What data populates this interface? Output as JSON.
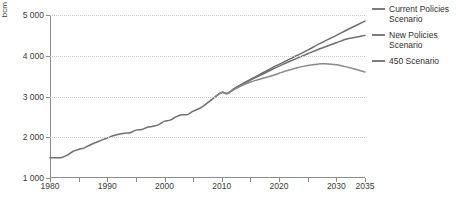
{
  "chart_data": {
    "type": "line",
    "title": "",
    "xlabel": "",
    "ylabel": "bcm",
    "unit": "bcm",
    "xlim": [
      1980,
      2035
    ],
    "ylim": [
      1000,
      5000
    ],
    "grid": true,
    "legend_position": "right",
    "y_ticks": [
      "1 000",
      "2 000",
      "3 000",
      "4 000",
      "5 000"
    ],
    "y_tick_values": [
      1000,
      2000,
      3000,
      4000,
      5000
    ],
    "x_ticks": [
      "1980",
      "1990",
      "2000",
      "2010",
      "2020",
      "2030",
      "2035"
    ],
    "x_tick_values": [
      1980,
      1990,
      2000,
      2010,
      2020,
      2030,
      2035
    ],
    "x_minor_ticks": [
      1985,
      1995,
      2005,
      2015,
      2025
    ],
    "series": [
      {
        "name": "Current Policies Scenario",
        "color": "#6f6f6f",
        "x": [
          1980,
          1981,
          1982,
          1983,
          1984,
          1985,
          1986,
          1987,
          1988,
          1989,
          1990,
          1991,
          1992,
          1993,
          1994,
          1995,
          1996,
          1997,
          1998,
          1999,
          2000,
          2001,
          2002,
          2003,
          2004,
          2005,
          2006,
          2007,
          2008,
          2009,
          2010,
          2011,
          2012,
          2013,
          2015,
          2017,
          2019,
          2020,
          2022,
          2025,
          2027,
          2030,
          2032,
          2035
        ],
        "values": [
          1500,
          1500,
          1505,
          1560,
          1650,
          1700,
          1740,
          1810,
          1870,
          1930,
          1980,
          2035,
          2075,
          2100,
          2110,
          2175,
          2190,
          2245,
          2270,
          2310,
          2395,
          2420,
          2500,
          2550,
          2555,
          2640,
          2700,
          2790,
          2900,
          3010,
          3100,
          3075,
          3180,
          3265,
          3420,
          3570,
          3720,
          3790,
          3930,
          4140,
          4290,
          4500,
          4645,
          4850
        ]
      },
      {
        "name": "New Policies Scenario",
        "color": "#6f6f6f",
        "x": [
          2009,
          2010,
          2011,
          2012,
          2013,
          2015,
          2017,
          2019,
          2020,
          2022,
          2025,
          2027,
          2030,
          2032,
          2035
        ],
        "values": [
          3010,
          3100,
          3075,
          3175,
          3255,
          3400,
          3540,
          3680,
          3745,
          3870,
          4050,
          4165,
          4320,
          4415,
          4500
        ]
      },
      {
        "name": "450 Scenario",
        "color": "#8a8a8a",
        "x": [
          2009,
          2010,
          2011,
          2012,
          2013,
          2014,
          2015,
          2016,
          2017,
          2018,
          2019,
          2020,
          2021,
          2023,
          2025,
          2027,
          2028,
          2030,
          2032,
          2033,
          2035
        ],
        "values": [
          3010,
          3100,
          3075,
          3160,
          3230,
          3300,
          3355,
          3400,
          3440,
          3480,
          3520,
          3570,
          3620,
          3700,
          3760,
          3800,
          3805,
          3780,
          3720,
          3680,
          3600
        ]
      }
    ]
  },
  "legend": {
    "items": [
      {
        "label_line1": "Current Policies",
        "label_line2": "Scenario"
      },
      {
        "label_line1": "New Policies",
        "label_line2": "Scenario"
      },
      {
        "label_line1": "450 Scenario",
        "label_line2": ""
      }
    ]
  }
}
